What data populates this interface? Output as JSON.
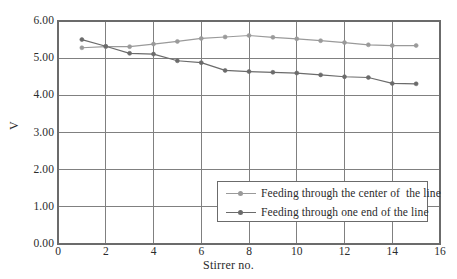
{
  "chart_data": {
    "type": "line",
    "title": "",
    "xlabel": "Stirrer no.",
    "ylabel": "V",
    "xlim": [
      0,
      16
    ],
    "ylim": [
      0,
      6
    ],
    "xticks": [
      "0",
      "2",
      "4",
      "6",
      "8",
      "10",
      "12",
      "14",
      "16"
    ],
    "xtick_values": [
      0,
      2,
      4,
      6,
      8,
      10,
      12,
      14,
      16
    ],
    "yticks": [
      "0.00",
      "1.00",
      "2.00",
      "3.00",
      "4.00",
      "5.00",
      "6.00"
    ],
    "ytick_values": [
      0,
      1,
      2,
      3,
      4,
      5,
      6
    ],
    "grid": true,
    "legend_position": "lower right",
    "x": [
      1,
      2,
      3,
      4,
      5,
      6,
      7,
      8,
      9,
      10,
      11,
      12,
      13,
      14,
      15
    ],
    "series": [
      {
        "name": "Feeding through the center of  the line",
        "color": "#9a9a9a",
        "marker": "circle",
        "values": [
          5.28,
          5.31,
          5.31,
          5.38,
          5.45,
          5.53,
          5.57,
          5.61,
          5.56,
          5.52,
          5.47,
          5.42,
          5.36,
          5.34,
          5.34
        ]
      },
      {
        "name": "Feeding through one end of the line",
        "color": "#6b6b6b",
        "marker": "circle",
        "values": [
          5.5,
          5.32,
          5.13,
          5.11,
          4.93,
          4.88,
          4.67,
          4.64,
          4.62,
          4.6,
          4.55,
          4.5,
          4.48,
          4.32,
          4.31
        ]
      }
    ]
  },
  "axes": {
    "frame_color": "#6b6b6b",
    "grid_color": "#808080",
    "background": "#ffffff"
  }
}
